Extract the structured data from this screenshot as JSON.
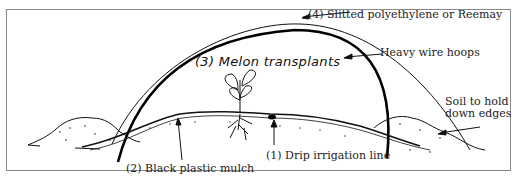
{
  "diagram": {
    "labels": {
      "cover": "(4) Slitted polyethylene or Reemay",
      "hoops": "Heavy wire hoops",
      "transplants": "(3) Melon transplants",
      "soil_line1": "Soil to hold",
      "soil_line2": "down edges",
      "mulch": "(2) Black plastic mulch",
      "drip": "(1) Drip irrigation line"
    },
    "colors": {
      "line": "#111111",
      "frame": "#8a8a8a",
      "background": "#ffffff"
    }
  }
}
